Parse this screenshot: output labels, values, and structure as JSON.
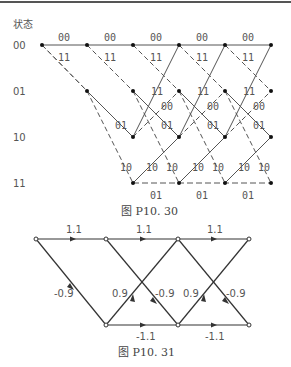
{
  "figure1": {
    "header": "状态",
    "states": [
      "00",
      "01",
      "10",
      "11"
    ],
    "caption": "图 P10. 30",
    "edge_labels": {
      "s00_to_00": "00",
      "s00_to_01": "11",
      "s01_to_10": "01",
      "s01_to_11": "10",
      "s10_to_00": "11",
      "s10_to_01": "00",
      "s11_to_10": "10",
      "s11_to_11": "01"
    }
  },
  "figure2": {
    "caption": "图 P10. 31",
    "top_labels": [
      "1.1",
      "1.1",
      "1.1"
    ],
    "bottom_labels": [
      "-1.1",
      "-1.1"
    ],
    "down_labels": [
      "-0.9",
      "-0.9",
      "-0.9"
    ],
    "up_labels": [
      "0.9",
      "0.9"
    ]
  }
}
